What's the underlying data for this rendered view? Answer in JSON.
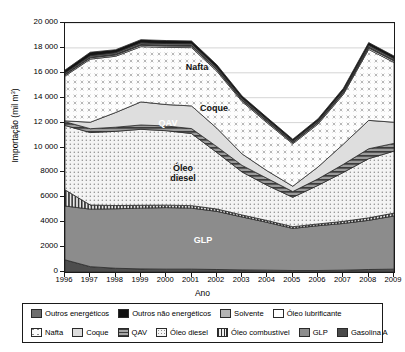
{
  "chart_data": {
    "type": "area",
    "title": "",
    "xlabel": "Ano",
    "ylabel": "Importação (mil m³)",
    "x": [
      1996,
      1997,
      1998,
      1999,
      2000,
      2001,
      2002,
      2003,
      2004,
      2005,
      2006,
      2007,
      2008,
      2009
    ],
    "categories": [
      "1996",
      "1997",
      "1998",
      "1999",
      "2000",
      "2001",
      "2002",
      "2003",
      "2004",
      "2005",
      "2006",
      "2007",
      "2008",
      "2009"
    ],
    "ylim": [
      0,
      20000
    ],
    "yticks": [
      0,
      2000,
      4000,
      6000,
      8000,
      10000,
      12000,
      14000,
      16000,
      18000,
      20000
    ],
    "ytick_labels": [
      "0",
      "2000",
      "4000",
      "6000",
      "8000",
      "10 000",
      "12 000",
      "14 000",
      "16 000",
      "18 000",
      "20 000"
    ],
    "grid": true,
    "grid_axis": "y",
    "stacked": true,
    "legend_position": "bottom",
    "series": [
      {
        "name": "Gasolina A",
        "values": [
          980,
          430,
          300,
          250,
          230,
          230,
          200,
          170,
          150,
          120,
          120,
          150,
          200,
          230
        ]
      },
      {
        "name": "GLP",
        "values": [
          4320,
          4620,
          4780,
          4880,
          4940,
          4900,
          4670,
          4250,
          3830,
          3380,
          3600,
          3750,
          3950,
          4270
        ]
      },
      {
        "name": "Óleo combustível",
        "values": [
          1300,
          330,
          260,
          230,
          200,
          200,
          190,
          160,
          150,
          140,
          140,
          170,
          200,
          230
        ]
      },
      {
        "name": "Óleo diesel",
        "values": [
          5170,
          5820,
          5960,
          6100,
          5980,
          5790,
          4540,
          3450,
          2820,
          2360,
          3100,
          3930,
          4750,
          4980
        ]
      },
      {
        "name": "QAV",
        "values": [
          300,
          310,
          330,
          350,
          380,
          400,
          470,
          530,
          560,
          460,
          520,
          650,
          800,
          620
        ]
      },
      {
        "name": "Coque",
        "values": [
          70,
          520,
          1180,
          1850,
          1720,
          1820,
          1480,
          920,
          600,
          430,
          960,
          1620,
          2280,
          1700
        ]
      },
      {
        "name": "Nafta",
        "values": [
          3600,
          5070,
          4520,
          4440,
          4590,
          4680,
          4580,
          4200,
          3850,
          3400,
          3450,
          4000,
          5700,
          4800
        ]
      },
      {
        "name": "Óleo lubrificante",
        "values": [
          90,
          100,
          100,
          110,
          110,
          110,
          110,
          100,
          100,
          90,
          100,
          110,
          120,
          120
        ]
      },
      {
        "name": "Solvente",
        "values": [
          50,
          55,
          55,
          60,
          60,
          60,
          55,
          50,
          50,
          45,
          50,
          55,
          60,
          60
        ]
      },
      {
        "name": "Outros energéticos",
        "values": [
          110,
          120,
          130,
          140,
          140,
          140,
          130,
          120,
          110,
          100,
          110,
          130,
          150,
          140
        ]
      },
      {
        "name": "Outros não energéticos",
        "values": [
          230,
          280,
          240,
          250,
          240,
          230,
          220,
          180,
          160,
          140,
          160,
          190,
          220,
          200
        ]
      }
    ],
    "annotations": [
      {
        "text": "Nafta",
        "x": 2000.0,
        "y": 16050
      },
      {
        "text": "Coque",
        "x": 2001.1,
        "y": 13000
      },
      {
        "text": "QAV",
        "x": 1999.3,
        "y": 11900
      },
      {
        "text": "Óleo\ndiesel",
        "x": 1999.6,
        "y": 9100
      },
      {
        "text": "GLP",
        "x": 2001.0,
        "y": 2450
      }
    ]
  },
  "axes": {
    "y_label": "Importação (mil m",
    "y_label_sup": "3",
    "y_label_tail": ")",
    "x_label": "Ano",
    "y_ticks": [
      "20 000",
      "18 000",
      "16 000",
      "14 000",
      "12 000",
      "10 000",
      "8000",
      "6000",
      "4000",
      "2000",
      "0"
    ],
    "x_ticks": [
      "1996",
      "1997",
      "1998",
      "1999",
      "2000",
      "2001",
      "2002",
      "2003",
      "2004",
      "2005",
      "2006",
      "2007",
      "2008",
      "2009"
    ]
  },
  "plot_labels": [
    {
      "name": "nafta",
      "text": "Nafta"
    },
    {
      "name": "coque",
      "text": "Coque"
    },
    {
      "name": "qav",
      "text": "QAV"
    },
    {
      "name": "oleo-diesel",
      "text": "Óleo",
      "text2": "diesel"
    },
    {
      "name": "glp",
      "text": "GLP"
    }
  ],
  "legend": {
    "row1": [
      {
        "label": "Outros energéticos",
        "pattern": "solid-darkgray",
        "color": "#6e6e6e"
      },
      {
        "label": "Outros não energéticos",
        "pattern": "solid-black",
        "color": "#111111"
      },
      {
        "label": "Solvente",
        "pattern": "solid-gray",
        "color": "#b4b4b4"
      },
      {
        "label": "Óleo lubrificante",
        "pattern": "solid-white",
        "color": "#ffffff"
      }
    ],
    "row2": [
      {
        "label": "Nafta",
        "pattern": "x-dots",
        "color": "#fbfbfb"
      },
      {
        "label": "Coque",
        "pattern": "solid-light",
        "color": "#dcdcdc"
      },
      {
        "label": "QAV",
        "pattern": "h-stripes",
        "color": "#8a8a8a"
      },
      {
        "label": "Óleo diesel",
        "pattern": "fine-dots",
        "color": "#f2f2f2"
      },
      {
        "label": "Óleo combustível",
        "pattern": "v-stripes",
        "color": "#555555"
      },
      {
        "label": "GLP",
        "pattern": "solid-mid",
        "color": "#8c8c8c"
      },
      {
        "label": "Gasolina A",
        "pattern": "solid-dark",
        "color": "#4a4a4a"
      }
    ]
  }
}
